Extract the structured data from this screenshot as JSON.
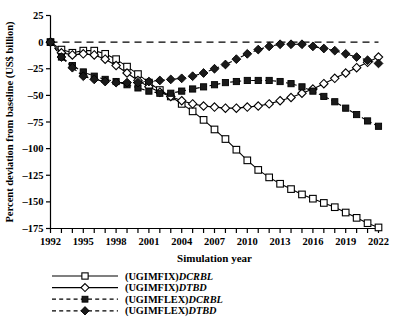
{
  "chart_data": {
    "type": "line",
    "title": "",
    "xlabel": "Simulation year",
    "ylabel": "Percent deviation from baseline (US$ billion)",
    "xlim": [
      1992,
      2022
    ],
    "ylim": [
      -175,
      25
    ],
    "yticks": [
      25,
      0,
      -25,
      -50,
      -75,
      -100,
      -125,
      -150,
      -175
    ],
    "ytick_labels": [
      "25",
      "0",
      "-25",
      "-50",
      "-75",
      "-100",
      "-125",
      "-150",
      "-175"
    ],
    "xticks": [
      1992,
      1993,
      1994,
      1995,
      1996,
      1997,
      1998,
      1999,
      2000,
      2001,
      2002,
      2003,
      2004,
      2005,
      2006,
      2007,
      2008,
      2009,
      2010,
      2011,
      2012,
      2013,
      2014,
      2015,
      2016,
      2017,
      2018,
      2019,
      2020,
      2021,
      2022
    ],
    "xtick_labels": [
      "1992",
      "1995",
      "1998",
      "2001",
      "2004",
      "2007",
      "2010",
      "2013",
      "2016",
      "2019",
      "2022"
    ],
    "xtick_label_years": [
      1992,
      1995,
      1998,
      2001,
      2004,
      2007,
      2010,
      2013,
      2016,
      2019,
      2022
    ],
    "grid": false,
    "zero_reference_line": 0,
    "zero_reference_style": "dashed",
    "legend_position": "below-plot",
    "x": [
      1992,
      1993,
      1994,
      1995,
      1996,
      1997,
      1998,
      1999,
      2000,
      2001,
      2002,
      2003,
      2004,
      2005,
      2006,
      2007,
      2008,
      2009,
      2010,
      2011,
      2012,
      2013,
      2014,
      2015,
      2016,
      2017,
      2018,
      2019,
      2020,
      2021,
      2022
    ],
    "series": [
      {
        "name": "(UGIMFIX)DCRBL",
        "marker": "open-square",
        "line_style": "solid",
        "values": [
          0,
          -7,
          -10,
          -8,
          -8,
          -11,
          -16,
          -23,
          -30,
          -38,
          -45,
          -51,
          -58,
          -65,
          -73,
          -82,
          -91,
          -101,
          -111,
          -120,
          -127,
          -133,
          -138,
          -143,
          -147,
          -151,
          -155,
          -160,
          -165,
          -170,
          -174
        ]
      },
      {
        "name": "(UGIMFIX)DTBD",
        "marker": "open-diamond",
        "line_style": "solid",
        "values": [
          0,
          -10,
          -12,
          -11,
          -12,
          -16,
          -22,
          -29,
          -36,
          -42,
          -47,
          -51,
          -55,
          -58,
          -60,
          -61,
          -62,
          -62,
          -61,
          -60,
          -58,
          -55,
          -52,
          -48,
          -44,
          -39,
          -34,
          -29,
          -24,
          -19,
          -14
        ]
      },
      {
        "name": "(UGIMFLEX)DCRBL",
        "marker": "filled-square",
        "line_style": "dashed",
        "values": [
          0,
          -14,
          -22,
          -28,
          -32,
          -35,
          -37,
          -40,
          -43,
          -46,
          -48,
          -48,
          -46,
          -44,
          -42,
          -40,
          -38,
          -37,
          -36,
          -36,
          -36,
          -37,
          -39,
          -42,
          -46,
          -51,
          -56,
          -62,
          -68,
          -74,
          -79
        ]
      },
      {
        "name": "(UGIMFLEX)DTBD",
        "marker": "filled-diamond",
        "line_style": "dashed",
        "values": [
          0,
          -14,
          -24,
          -32,
          -35,
          -37,
          -38,
          -38,
          -38,
          -37,
          -36,
          -35,
          -34,
          -32,
          -29,
          -25,
          -21,
          -16,
          -11,
          -7,
          -4,
          -2,
          -2,
          -2,
          -4,
          -6,
          -8,
          -11,
          -14,
          -17,
          -20
        ]
      }
    ],
    "legend": [
      {
        "prefix": "(UGIMFIX)",
        "italic": "DCRBL",
        "marker": "open-square",
        "line_style": "solid"
      },
      {
        "prefix": "(UGIMFIX)",
        "italic": "DTBD",
        "marker": "open-diamond",
        "line_style": "solid"
      },
      {
        "prefix": "(UGIMFLEX)",
        "italic": "DCRBL",
        "marker": "filled-square",
        "line_style": "dashed"
      },
      {
        "prefix": "(UGIMFLEX)",
        "italic": "DTBD",
        "marker": "filled-diamond",
        "line_style": "dashed"
      }
    ],
    "colors": {
      "line": "#000000",
      "marker_fill_open": "#ffffff",
      "marker_fill_closed": "#1a1a1a",
      "axis": "#000000",
      "background": "#ffffff"
    }
  }
}
